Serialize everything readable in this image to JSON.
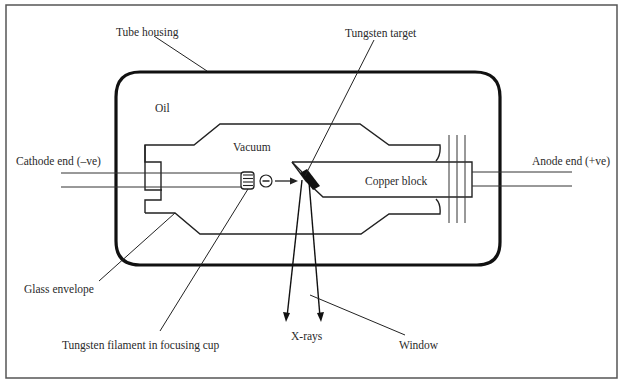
{
  "diagram": {
    "labels": {
      "tube_housing": "Tube housing",
      "tungsten_target": "Tungsten target",
      "oil": "Oil",
      "vacuum": "Vacuum",
      "cathode_end": "Cathode end (–ve)",
      "anode_end": "Anode end (+ve)",
      "copper_block": "Copper block",
      "glass_envelope": "Glass envelope",
      "tungsten_filament": "Tungsten filament in focusing cup",
      "x_rays": "X-rays",
      "window": "Window"
    },
    "electron_symbol": "−"
  }
}
